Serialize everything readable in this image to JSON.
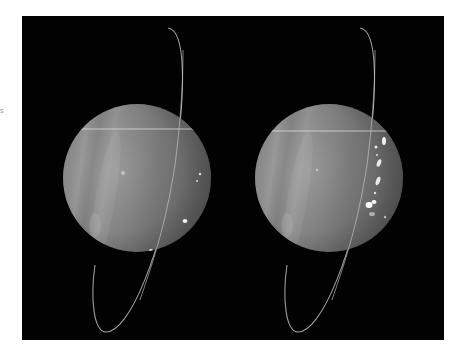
{
  "image": {
    "description": "Two side-by-side grayscale images of Uranus with its thin nearly edge-on ring, showing banded atmosphere and bright cloud features",
    "background_color": "#020202",
    "panels": [
      {
        "label": "left-planet",
        "cx": 137,
        "cy": 178,
        "r": 74,
        "features": [
          "faint horizontal scan line",
          "small bright spots on right limb",
          "bright spot near bottom"
        ]
      },
      {
        "label": "right-planet",
        "cx": 329,
        "cy": 178,
        "r": 74,
        "features": [
          "faint horizontal scan line",
          "chain of bright cloud features on right side"
        ]
      }
    ],
    "planet_color": "#8a8a8a",
    "ring_color": "#bdbdbd"
  },
  "edge_mark": "s"
}
